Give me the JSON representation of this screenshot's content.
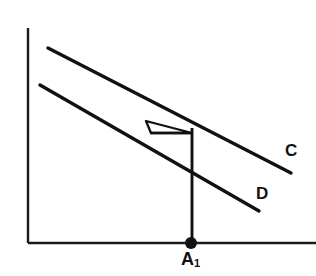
{
  "figure": {
    "background_color": "#ffffff",
    "stroke_color": "#1a1a1a",
    "width": 316,
    "height": 276
  },
  "axes": {
    "y_axis": {
      "x": 28,
      "y_top": 28,
      "y_bottom": 243,
      "stroke_width": 2.4
    },
    "x_axis": {
      "y": 243,
      "x_left": 28,
      "x_right": 316,
      "stroke_width": 2.4
    }
  },
  "curves": [
    {
      "name": "curve-c",
      "label": "C",
      "label_x": 285,
      "label_y": 142,
      "x1": 48,
      "y1": 48,
      "x2": 291,
      "y2": 173,
      "stroke_width": 3.2
    },
    {
      "name": "curve-d",
      "label": "D",
      "label_x": 256,
      "label_y": 185,
      "x1": 40,
      "y1": 85,
      "x2": 259,
      "y2": 211,
      "stroke_width": 3.2
    }
  ],
  "construction": {
    "intersection": {
      "x": 146,
      "y": 121
    },
    "horizontal_segment": {
      "x1": 151,
      "y1": 133,
      "x2": 192,
      "y2": 133,
      "stroke_width": 2.4
    },
    "vertical_drop": {
      "x": 192,
      "y_top": 129,
      "y_bottom": 243,
      "stroke_width": 2.8
    },
    "triangle_vertices": "146,121 192,133 151,133"
  },
  "points": [
    {
      "name": "point-a1",
      "label": "A",
      "subscript": "1",
      "x": 191,
      "y": 243,
      "radius": 6
    }
  ],
  "labels": {
    "curve_c": "C",
    "curve_d": "D",
    "point_a_base": "A",
    "point_a_sub": "1"
  }
}
